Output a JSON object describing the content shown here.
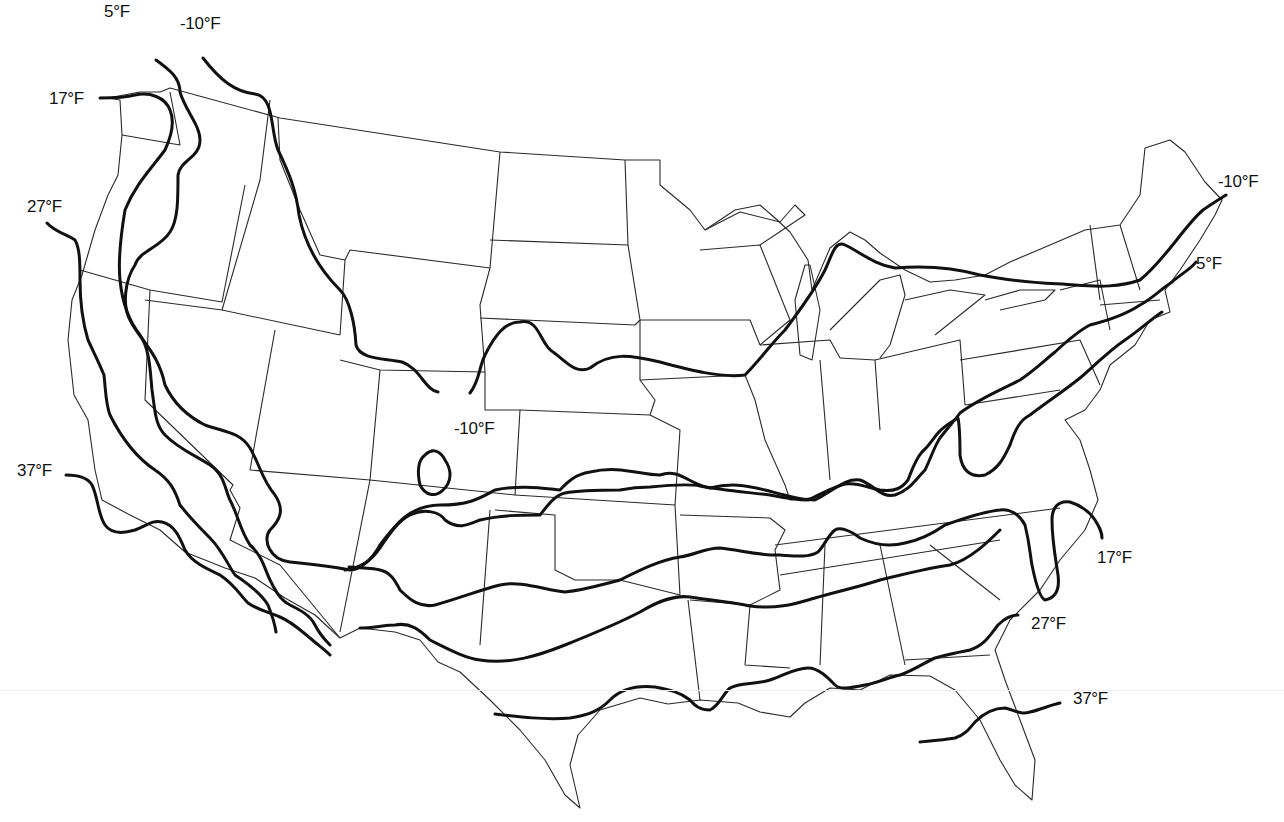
{
  "map": {
    "type": "isotherm map of the contiguous United States",
    "line_color": "#111111",
    "border_color": "#2a2a2a",
    "background": "#ffffff"
  },
  "isotherms": [
    {
      "id": "iso-minus10-north",
      "value": -10,
      "label": "-10°F",
      "d": "M203,58 C220,80 235,92 255,94 C275,97 270,130 278,150 C290,175 296,190 299,215 C305,245 320,270 340,290 C350,300 355,325 356,345 C360,360 385,358 402,362 C420,368 425,390 438,392 M470,393 C480,380 478,370 485,355 C495,335 505,322 520,322 C540,318 540,345 553,352 C565,360 575,375 590,368 C610,352 630,355 660,362 C690,370 720,378 745,375 C760,360 770,345 785,330 C800,310 815,290 825,270 C832,255 835,240 845,245 C860,252 875,265 895,268 C930,265 955,268 980,275 C1020,283 1050,283 1075,285 C1100,287 1120,287 1140,280 C1165,260 1185,225 1203,210 C1210,205 1218,200 1226,195"
    },
    {
      "id": "iso-minus10-colorado",
      "value": -10,
      "label": "-10°F",
      "d": "M425,455 C432,448 440,450 445,460 C452,470 452,482 443,490 C435,498 425,495 420,485 C417,472 418,460 425,455 Z"
    },
    {
      "id": "iso-5",
      "value": 5,
      "label": "5°F",
      "d": "M156,60 C170,70 180,78 180,92 C185,110 200,125 200,140 C200,158 180,160 178,175 C178,200 178,220 170,232 C160,248 140,250 135,265 C125,280 122,305 130,320 C140,340 158,352 165,385 C172,400 185,415 205,425 C225,432 240,432 250,448 C260,465 262,480 275,495 C285,510 280,520 270,530 C262,540 270,560 290,562 C320,565 340,568 350,570 C360,570 372,560 380,545 C395,525 410,505 440,505 C470,505 480,498 495,490 C520,485 540,488 560,490 C565,485 572,475 590,472 C620,465 640,475 660,475 C680,468 688,484 710,488 C730,483 745,485 765,490 C785,495 800,500 815,500 C835,490 845,478 860,480 C875,485 880,498 895,495 C910,490 915,480 925,470 C930,460 935,445 940,438 C950,425 955,420 960,413 C980,398 1005,388 1020,380 C1035,370 1045,360 1055,352 C1068,340 1080,330 1090,325 C1110,320 1125,315 1140,305 C1150,300 1160,290 1172,282 C1180,275 1192,268 1196,262"
    },
    {
      "id": "iso-17",
      "value": 17,
      "label": "17°F",
      "d": "M100,98 C118,98 128,97 135,95 C150,92 165,97 170,110 C175,122 172,135 165,150 C150,170 135,185 125,210 C120,240 118,260 120,280 C122,300 128,320 140,335 C150,350 150,370 152,390 C155,410 155,425 165,435 C180,450 195,455 210,465 C225,475 225,490 230,500 C238,515 240,530 250,545 C262,555 265,570 270,580 C275,590 280,600 290,605 C300,610 310,615 315,625 C320,635 325,640 330,645 M345,570 C360,568 372,560 380,548 C392,530 400,520 410,515 C425,508 440,512 445,520 C458,530 468,525 480,520 C500,515 520,515 540,515 C548,505 555,495 565,493 C580,490 600,490 620,490 C630,488 640,487 650,487 C670,485 690,484 700,486 C720,490 745,492 770,495 C785,498 795,500 808,500 C820,495 830,488 845,484 C858,482 868,488 880,490 C895,492 902,488 908,480 C912,470 915,460 922,452 C930,445 932,440 938,433 C945,425 955,420 958,418 C960,428 960,440 960,455 C962,470 970,478 985,475 C1000,468 1005,455 1010,445 C1015,430 1020,420 1030,415 C1050,400 1065,390 1080,378 C1095,365 1110,350 1125,340 C1140,330 1150,320 1162,312"
    },
    {
      "id": "iso-27",
      "value": 27,
      "label": "27°F",
      "d": "M47,223 C55,232 68,235 75,240 C80,248 80,265 80,280 C80,300 82,320 88,340 C95,355 100,365 104,375 C106,395 106,405 110,415 C125,445 140,460 155,470 C170,480 175,490 180,505 C190,518 200,528 210,538 C222,550 228,565 235,575 C250,585 262,595 268,605 C272,615 275,625 276,632 M349,567 C362,568 375,568 380,570 C390,572 395,580 400,590 C410,600 420,608 435,605 C460,598 480,590 500,585 C520,580 545,590 565,592 C585,590 600,585 620,580 C640,570 660,560 680,557 C695,555 705,548 720,548 C740,550 760,556 780,555 C795,556 808,558 818,552 C825,545 828,535 835,530 C840,527 850,530 860,538 C875,545 890,547 905,543 C920,540 935,532 945,525 C960,520 980,512 1000,510 C1010,508 1020,515 1025,525 C1030,545 1030,555 1032,565 C1035,580 1040,598 1045,600 C1055,598 1060,590 1058,575 C1055,555 1052,540 1052,520 C1052,508 1058,500 1070,502 C1080,505 1090,512 1095,520 C1100,528 1102,532 1102,538"
    },
    {
      "id": "iso-37",
      "value": 37,
      "label": "37°F",
      "d": "M66,475 C78,475 88,478 92,485 C98,497 98,515 105,525 C112,535 125,533 135,530 C148,525 152,520 162,522 C175,525 180,538 185,550 C192,562 205,568 220,575 C235,585 240,595 248,603 C258,610 268,612 280,617 C292,622 300,630 310,638 C318,645 325,650 330,655 M360,628 C372,628 385,625 395,625 C410,622 420,630 430,640 C450,650 465,658 480,660 C510,665 540,655 565,645 C590,635 615,625 640,612 C660,600 675,595 690,597 C710,600 730,602 750,606 C780,610 800,602 815,598 C835,592 855,588 880,580 C900,575 930,568 950,565 C970,560 990,540 1000,530 M495,714 C520,717 545,720 570,718 C590,715 600,710 610,700 C620,690 635,685 655,687 C670,690 680,692 690,700 C695,706 700,710 710,710 C720,705 722,695 730,688 C740,682 755,685 770,680 C785,675 795,668 808,668 C820,668 830,680 835,685 C840,690 850,688 865,685 C880,682 890,677 900,675 C915,670 925,662 935,658 C945,655 960,652 970,650 C985,645 990,635 998,625 C1005,618 1012,615 1018,615 M920,742 C935,740 945,740 955,738 C965,735 970,728 975,722 C985,712 995,708 1005,708 C1015,710 1020,715 1030,712 C1040,710 1050,705 1060,703"
    }
  ],
  "labels": [
    {
      "id": "label-5-north",
      "text": "5°F",
      "x": 104,
      "y": 2
    },
    {
      "id": "label-minus10-northwest",
      "text": "-10°F",
      "x": 180,
      "y": 14
    },
    {
      "id": "label-17-west",
      "text": "17°F",
      "x": 49,
      "y": 89
    },
    {
      "id": "label-27-west",
      "text": "27°F",
      "x": 27,
      "y": 197
    },
    {
      "id": "label-37-west",
      "text": "37°F",
      "x": 17,
      "y": 461
    },
    {
      "id": "label-minus10-colorado",
      "text": "-10°F",
      "x": 454,
      "y": 419
    },
    {
      "id": "label-minus10-northeast",
      "text": "-10°F",
      "x": 1218,
      "y": 172
    },
    {
      "id": "label-5-northeast",
      "text": "5°F",
      "x": 1196,
      "y": 254
    },
    {
      "id": "label-17-east",
      "text": "17°F",
      "x": 1097,
      "y": 548
    },
    {
      "id": "label-27-east",
      "text": "27°F",
      "x": 1031,
      "y": 614
    },
    {
      "id": "label-37-east",
      "text": "37°F",
      "x": 1073,
      "y": 689
    }
  ]
}
